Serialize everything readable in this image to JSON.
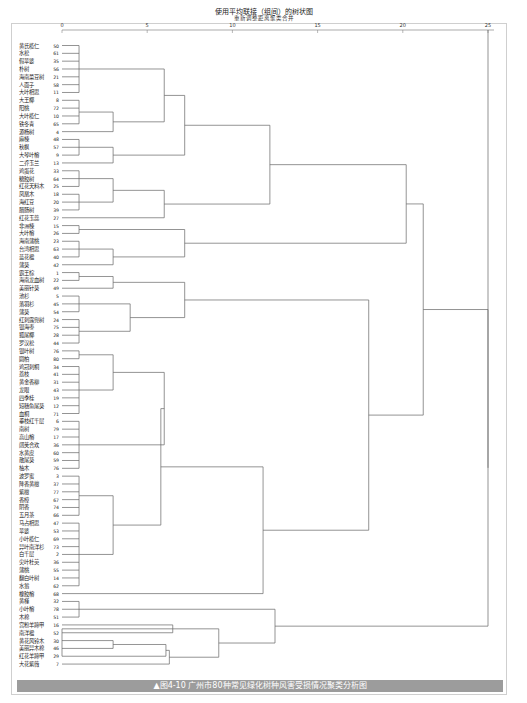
{
  "chart_data": {
    "type": "dendrogram",
    "title": "使用平均联接（组间）的树状图",
    "subtitle": "重新调整距离聚类合并",
    "xlabel": "重新调整距离聚类合并",
    "xlim": [
      0,
      25
    ],
    "x_ticks": [
      0,
      5,
      10,
      15,
      20,
      25
    ],
    "orientation": "horizontal",
    "leaves": [
      {
        "name": "黄氏榄仁",
        "id": 50
      },
      {
        "name": "水松",
        "id": 61
      },
      {
        "name": "假苹婆",
        "id": 35
      },
      {
        "name": "朴树",
        "id": 56
      },
      {
        "name": "海南菜豆树",
        "id": 21
      },
      {
        "name": "人面子",
        "id": 58
      },
      {
        "name": "大叶相思",
        "id": 11
      },
      {
        "name": "大王椰",
        "id": 8
      },
      {
        "name": "阳桃",
        "id": 72
      },
      {
        "name": "大叶榄仁",
        "id": 10
      },
      {
        "name": "铁冬青",
        "id": 65
      },
      {
        "name": "源杨树",
        "id": 4
      },
      {
        "name": "麻楝",
        "id": 48
      },
      {
        "name": "秋枫",
        "id": 57
      },
      {
        "name": "大琴叶榕",
        "id": 9
      },
      {
        "name": "二乔玉兰",
        "id": 13
      },
      {
        "name": "鸡蛋花",
        "id": 33
      },
      {
        "name": "糖胶树",
        "id": 64
      },
      {
        "name": "红花天料木",
        "id": 25
      },
      {
        "name": "凤凰木",
        "id": 18
      },
      {
        "name": "海红豆",
        "id": 20
      },
      {
        "name": "腊肠树",
        "id": 39
      },
      {
        "name": "红花玉蕊",
        "id": 27
      },
      {
        "name": "非洲楝",
        "id": 15
      },
      {
        "name": "大叶榕",
        "id": 26
      },
      {
        "name": "海南蒲桃",
        "id": 23
      },
      {
        "name": "台湾相思",
        "id": 63
      },
      {
        "name": "蓝花楹",
        "id": 40
      },
      {
        "name": "蒲葵",
        "id": 42
      },
      {
        "name": "霸王棕",
        "id": 1
      },
      {
        "name": "海南龙血树",
        "id": 22
      },
      {
        "name": "美丽针葵",
        "id": 49
      },
      {
        "name": "池杉",
        "id": 5
      },
      {
        "name": "落羽杉",
        "id": 45
      },
      {
        "name": "蒲葵",
        "id": 54
      },
      {
        "name": "红刺露兜树",
        "id": 24
      },
      {
        "name": "银海枣",
        "id": 75
      },
      {
        "name": "狐尾椰",
        "id": 28
      },
      {
        "name": "罗汉松",
        "id": 44
      },
      {
        "name": "银叶树",
        "id": 76
      },
      {
        "name": "圆柏",
        "id": 80
      },
      {
        "name": "鸡冠刺桐",
        "id": 34
      },
      {
        "name": "荔枝",
        "id": 41
      },
      {
        "name": "黄金香柳",
        "id": 31
      },
      {
        "name": "龙眼",
        "id": 43
      },
      {
        "name": "四季桂",
        "id": 19
      },
      {
        "name": "短穗鱼尾葵",
        "id": 12
      },
      {
        "name": "血桐",
        "id": 71
      },
      {
        "name": "垂枝红千层",
        "id": 6
      },
      {
        "name": "南树",
        "id": 79
      },
      {
        "name": "高山榕",
        "id": 17
      },
      {
        "name": "阔荚合欢",
        "id": 36
      },
      {
        "name": "水黄皮",
        "id": 60
      },
      {
        "name": "散尾葵",
        "id": 59
      },
      {
        "name": "柚木",
        "id": 76
      },
      {
        "name": "波罗蜜",
        "id": 3
      },
      {
        "name": "降香黄檀",
        "id": 37
      },
      {
        "name": "紫檀",
        "id": 77
      },
      {
        "name": "香樟",
        "id": 67
      },
      {
        "name": "阴香",
        "id": 74
      },
      {
        "name": "五月茶",
        "id": 66
      },
      {
        "name": "马占相思",
        "id": 47
      },
      {
        "name": "苹婆",
        "id": 53
      },
      {
        "name": "小叶榄仁",
        "id": 69
      },
      {
        "name": "异叶南洋杉",
        "id": 73
      },
      {
        "name": "白千层",
        "id": 2
      },
      {
        "name": "尖叶杜英",
        "id": 36
      },
      {
        "name": "蒲桃",
        "id": 55
      },
      {
        "name": "翻白叶树",
        "id": 14
      },
      {
        "name": "水翁",
        "id": 62
      },
      {
        "name": "橡胶榕",
        "id": 68
      },
      {
        "name": "黄槿",
        "id": 32
      },
      {
        "name": "小叶榕",
        "id": 78
      },
      {
        "name": "木棉",
        "id": 51
      },
      {
        "name": "宫粉羊蹄甲",
        "id": 16
      },
      {
        "name": "南洋楹",
        "id": 52
      },
      {
        "name": "黄花风铃木",
        "id": 30
      },
      {
        "name": "美丽异木棉",
        "id": 46
      },
      {
        "name": "红花羊蹄甲",
        "id": 29
      },
      {
        "name": "大花紫薇",
        "id": 7
      }
    ],
    "major_clusters": [
      {
        "members_from": "黄氏榄仁",
        "members_to": "二乔玉兰",
        "merge_height": 6.0
      },
      {
        "members_from": "鸡蛋花",
        "members_to": "红花玉蕊",
        "merge_height": 3.0
      },
      {
        "members_from": "黄氏榄仁",
        "members_to": "红花玉蕊",
        "merge_height": 7.2
      },
      {
        "members_from": "非洲楝",
        "members_to": "蒲葵",
        "merge_height": 3.0
      },
      {
        "members_from": "黄氏榄仁",
        "members_to": "蒲葵",
        "merge_height": 11.2
      },
      {
        "members_from": "霸王棕",
        "members_to": "罗汉松",
        "merge_height": 3.0
      },
      {
        "members_from": "银叶树",
        "members_to": "橡胶榕",
        "merge_height": 4.0
      },
      {
        "members_from": "霸王棕",
        "members_to": "橡胶榕",
        "merge_height": 8.0
      },
      {
        "members_from": "黄氏榄仁",
        "members_to": "橡胶榕",
        "merge_height": 14.3
      },
      {
        "members_from": "黄槿",
        "members_to": "木棉",
        "merge_height": 2.6
      },
      {
        "members_from": "宫粉羊蹄甲",
        "members_to": "大花紫薇",
        "merge_height": 5.8
      },
      {
        "members_from": "黄槿",
        "members_to": "大花紫薇",
        "merge_height": 7.2
      },
      {
        "members_from": "黄氏榄仁",
        "members_to": "大花紫薇",
        "merge_height": 21.2
      },
      {
        "members_from": "all",
        "members_to": "all",
        "merge_height": 25.0
      }
    ],
    "grid": false,
    "legend": "none"
  },
  "header": {
    "title": "使用平均联接（组间）的树状图",
    "subtitle": "重新调整距离聚类合并"
  },
  "axis": {
    "ticks": [
      "0",
      "5",
      "10",
      "15",
      "20",
      "25"
    ]
  },
  "caption": {
    "text": "▲图4-10 广州市80种常见绿化树种风害受损情况聚类分析图"
  },
  "colors": {
    "line": "#555555",
    "caption_bg": "#9c9c9c",
    "caption_text": "#ffffff"
  }
}
